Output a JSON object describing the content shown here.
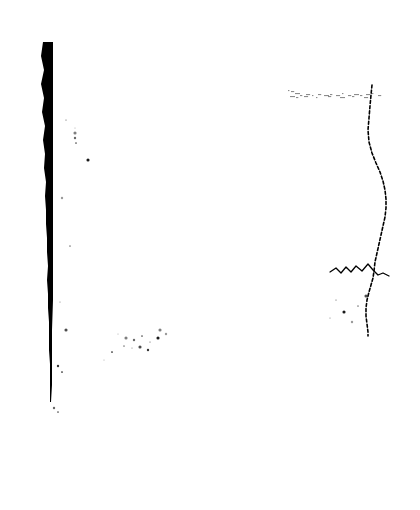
{
  "page": {
    "title": "Scanned document page",
    "width": 420,
    "height": 510,
    "background_color": "#ffffff",
    "ink_color": "#000000",
    "condition": "blank page, heavily degraded scan with binding shadow and illegible residual marks",
    "legible_text": "none"
  },
  "artifacts": {
    "binding_bar": {
      "name": "binding-edge-bar",
      "description": "thick solid black vertical band along the left gutter, widest at the top and tapering to a thin line near the bottom, ragged on its left side",
      "color": "#000000",
      "x_top": 43,
      "x_bottom": 50,
      "y_start": 42,
      "y_end": 402,
      "width_top": 10,
      "width_bottom": 2
    },
    "page_edge_line": {
      "name": "page-edge-line",
      "description": "broken wavy vertical line marking the curled right edge of the scanned sheet",
      "color": "#000000",
      "x_center": 372,
      "y_start": 85,
      "y_end": 336
    },
    "smudge_row": {
      "name": "illegible-text-row",
      "description": "horizontal row of smeared illegible ink marks, residual of a printed line of text",
      "color": "#000000",
      "x_start": 286,
      "x_end": 379,
      "y_start": 88,
      "y_end": 100,
      "readable": "illegible"
    },
    "handwriting_squiggle": {
      "name": "handwriting-squiggle",
      "description": "short cursive pen stroke crossing the right page-edge line",
      "color": "#000000",
      "x_start": 328,
      "x_end": 392,
      "y_start": 262,
      "y_end": 288,
      "readable": "illegible"
    },
    "specks": {
      "name": "speckle-field",
      "description": "scattered isolated dust and ink specks across the white field",
      "color": "#000000",
      "count": 34
    }
  },
  "chart_data": {
    "type": "scatter",
    "title": "",
    "xlabel": "",
    "ylabel": "",
    "xlim": [
      0,
      420
    ],
    "ylim": [
      0,
      510
    ],
    "grid": false,
    "legend": "none",
    "series": [
      {
        "name": "binding-bar-left-edge",
        "kind": "polyline",
        "stroke": "#000000",
        "points": [
          [
            43,
            42
          ],
          [
            41,
            56
          ],
          [
            44,
            70
          ],
          [
            41,
            84
          ],
          [
            44,
            98
          ],
          [
            42,
            112
          ],
          [
            45,
            126
          ],
          [
            43,
            140
          ],
          [
            45,
            154
          ],
          [
            44,
            168
          ],
          [
            46,
            182
          ],
          [
            45,
            196
          ],
          [
            46,
            210
          ],
          [
            46,
            224
          ],
          [
            47,
            238
          ],
          [
            47,
            252
          ],
          [
            48,
            266
          ],
          [
            47,
            280
          ],
          [
            48,
            294
          ],
          [
            48,
            308
          ],
          [
            49,
            322
          ],
          [
            49,
            336
          ],
          [
            49,
            350
          ],
          [
            50,
            364
          ],
          [
            50,
            378
          ],
          [
            50,
            392
          ],
          [
            50,
            402
          ]
        ]
      },
      {
        "name": "binding-bar-right-edge",
        "kind": "polyline",
        "stroke": "#000000",
        "points": [
          [
            53,
            42
          ],
          [
            53,
            70
          ],
          [
            53,
            110
          ],
          [
            53,
            150
          ],
          [
            53,
            190
          ],
          [
            53,
            230
          ],
          [
            53,
            270
          ],
          [
            53,
            300
          ],
          [
            52,
            330
          ],
          [
            52,
            360
          ],
          [
            52,
            385
          ],
          [
            51,
            402
          ]
        ]
      },
      {
        "name": "page-edge-line",
        "kind": "polyline",
        "stroke": "#000000",
        "points": [
          [
            372,
            85
          ],
          [
            371,
            95
          ],
          [
            370,
            106
          ],
          [
            369,
            118
          ],
          [
            368,
            130
          ],
          [
            369,
            142
          ],
          [
            372,
            153
          ],
          [
            376,
            163
          ],
          [
            380,
            172
          ],
          [
            383,
            181
          ],
          [
            385,
            190
          ],
          [
            386,
            199
          ],
          [
            386,
            208
          ],
          [
            385,
            217
          ],
          [
            383,
            226
          ],
          [
            381,
            235
          ],
          [
            379,
            244
          ],
          [
            377,
            253
          ],
          [
            375,
            262
          ],
          [
            374,
            271
          ],
          [
            373,
            278
          ],
          [
            371,
            285
          ],
          [
            369,
            292
          ],
          [
            367,
            300
          ],
          [
            366,
            308
          ],
          [
            366,
            316
          ],
          [
            367,
            324
          ],
          [
            368,
            332
          ],
          [
            368,
            336
          ]
        ]
      },
      {
        "name": "smudge-row",
        "kind": "marks",
        "stroke": "#000000",
        "points": [
          [
            288,
            90
          ],
          [
            291,
            91
          ],
          [
            295,
            93
          ],
          [
            300,
            95
          ],
          [
            306,
            94
          ],
          [
            312,
            95
          ],
          [
            318,
            94
          ],
          [
            324,
            95
          ],
          [
            330,
            94
          ],
          [
            336,
            95
          ],
          [
            342,
            93
          ],
          [
            348,
            95
          ],
          [
            354,
            94
          ],
          [
            360,
            95
          ],
          [
            366,
            94
          ],
          [
            372,
            93
          ],
          [
            378,
            95
          ],
          [
            290,
            96
          ],
          [
            296,
            97
          ],
          [
            304,
            96
          ],
          [
            316,
            97
          ],
          [
            328,
            96
          ],
          [
            340,
            97
          ],
          [
            352,
            96
          ],
          [
            364,
            97
          ]
        ]
      },
      {
        "name": "handwriting-squiggle",
        "kind": "polyline",
        "stroke": "#000000",
        "points": [
          [
            330,
            272
          ],
          [
            336,
            268
          ],
          [
            341,
            273
          ],
          [
            346,
            267
          ],
          [
            351,
            272
          ],
          [
            356,
            266
          ],
          [
            362,
            271
          ],
          [
            368,
            264
          ],
          [
            373,
            270
          ],
          [
            378,
            275
          ],
          [
            383,
            273
          ],
          [
            389,
            276
          ]
        ]
      },
      {
        "name": "speckle-field",
        "kind": "points",
        "stroke": "#000000",
        "points": [
          [
            75,
            128
          ],
          [
            75,
            133
          ],
          [
            75,
            138
          ],
          [
            76,
            143
          ],
          [
            66,
            120
          ],
          [
            88,
            160
          ],
          [
            62,
            198
          ],
          [
            70,
            246
          ],
          [
            60,
            302
          ],
          [
            66,
            330
          ],
          [
            58,
            366
          ],
          [
            62,
            372
          ],
          [
            118,
            334
          ],
          [
            126,
            338
          ],
          [
            134,
            340
          ],
          [
            142,
            336
          ],
          [
            150,
            342
          ],
          [
            158,
            338
          ],
          [
            166,
            334
          ],
          [
            124,
            346
          ],
          [
            132,
            348
          ],
          [
            140,
            347
          ],
          [
            148,
            350
          ],
          [
            112,
            352
          ],
          [
            104,
            360
          ],
          [
            160,
            330
          ],
          [
            54,
            408
          ],
          [
            58,
            412
          ],
          [
            336,
            300
          ],
          [
            344,
            312
          ],
          [
            352,
            322
          ],
          [
            358,
            306
          ],
          [
            330,
            318
          ],
          [
            366,
            296
          ]
        ]
      }
    ]
  }
}
